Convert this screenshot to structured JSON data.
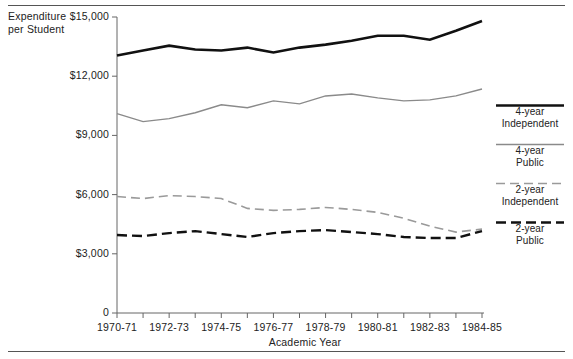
{
  "axes": {
    "y_title_line1": "Expenditure",
    "y_title_line2": "per Student",
    "x_title": "Academic Year",
    "y_ticks": [
      "$15,000",
      "$12,000",
      "$9,000",
      "$6,000",
      "$3,000",
      "0"
    ],
    "x_ticks_labeled": [
      "1970-71",
      "1972-73",
      "1974-75",
      "1976-77",
      "1978-79",
      "1980-81",
      "1982-83",
      "1984-85"
    ]
  },
  "legend": {
    "items": [
      {
        "line1": "4-year",
        "line2": "Independent",
        "style": "solid",
        "color": "#111111",
        "width": 2.6
      },
      {
        "line1": "4-year",
        "line2": "Public",
        "style": "solid",
        "color": "#8a8a8a",
        "width": 1.4
      },
      {
        "line1": "2-year",
        "line2": "Independent",
        "style": "dashed",
        "color": "#9a9a9a",
        "width": 1.6
      },
      {
        "line1": "2-year",
        "line2": "Public",
        "style": "dashed",
        "color": "#111111",
        "width": 2.4
      }
    ]
  },
  "chart_data": {
    "type": "line",
    "title": "",
    "xlabel": "Academic Year",
    "ylabel": "Expenditure per Student",
    "ylim": [
      0,
      15000
    ],
    "yticks": [
      0,
      3000,
      6000,
      9000,
      12000,
      15000
    ],
    "grid": false,
    "legend_position": "right",
    "x": [
      "1970-71",
      "1971-72",
      "1972-73",
      "1973-74",
      "1974-75",
      "1975-76",
      "1976-77",
      "1977-78",
      "1978-79",
      "1979-80",
      "1980-81",
      "1981-82",
      "1982-83",
      "1983-84",
      "1984-85"
    ],
    "series": [
      {
        "name": "4-year Independent",
        "color": "#111111",
        "style": "solid",
        "width": 2.6,
        "values": [
          13050,
          13300,
          13550,
          13350,
          13300,
          13450,
          13200,
          13450,
          13600,
          13800,
          14050,
          14050,
          13850,
          14300,
          14800
        ]
      },
      {
        "name": "4-year Public",
        "color": "#8a8a8a",
        "style": "solid",
        "width": 1.4,
        "values": [
          10100,
          9700,
          9850,
          10150,
          10550,
          10400,
          10750,
          10600,
          11000,
          11100,
          10900,
          10750,
          10800,
          11000,
          11350
        ]
      },
      {
        "name": "2-year Independent",
        "color": "#9a9a9a",
        "style": "dashed",
        "width": 1.6,
        "values": [
          5900,
          5800,
          5950,
          5900,
          5800,
          5300,
          5200,
          5250,
          5350,
          5250,
          5100,
          4800,
          4400,
          4100,
          4250
        ]
      },
      {
        "name": "2-year Public",
        "color": "#111111",
        "style": "dashed",
        "width": 2.4,
        "values": [
          3950,
          3900,
          4050,
          4150,
          4000,
          3850,
          4050,
          4150,
          4200,
          4100,
          4000,
          3850,
          3800,
          3800,
          4150
        ]
      }
    ]
  }
}
